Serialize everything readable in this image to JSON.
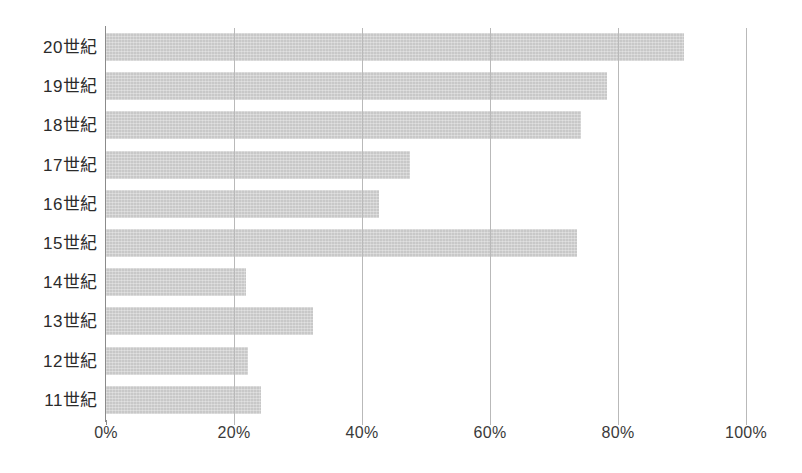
{
  "chart_data": {
    "type": "bar",
    "orientation": "horizontal",
    "title": "",
    "subtitle": "",
    "xlabel": "",
    "ylabel": "",
    "categories": [
      "20世紀",
      "19世紀",
      "18世紀",
      "17世紀",
      "16世紀",
      "15世紀",
      "14世紀",
      "13世紀",
      "12世紀",
      "11世紀"
    ],
    "values": [
      90.3,
      78.3,
      74.2,
      47.5,
      42.7,
      73.6,
      21.9,
      32.3,
      22.2,
      24.2
    ],
    "value_unit": "%",
    "xlim": [
      0,
      100
    ],
    "xticks": [
      0,
      20,
      40,
      60,
      80,
      100
    ],
    "xtick_labels": [
      "0%",
      "20%",
      "40%",
      "60%",
      "80%",
      "100%"
    ],
    "grid": true,
    "grid_axis": "x",
    "legend": false,
    "bar_color": "#c8c8c8",
    "axis_color": "#8b8b8b",
    "gridline_color": "#b9b9b9",
    "text_color": "#2b2b2b",
    "background_color": "#ffffff"
  }
}
